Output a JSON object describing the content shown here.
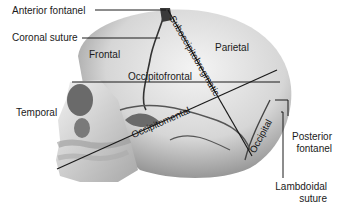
{
  "diagram": {
    "bones": [
      {
        "id": "frontal",
        "label": "Frontal"
      },
      {
        "id": "parietal",
        "label": "Parietal"
      },
      {
        "id": "temporal",
        "label": "Temporal"
      },
      {
        "id": "occipital",
        "label": "Occipital"
      }
    ],
    "landmarks": [
      {
        "id": "anterior-fontanel",
        "label": "Anterior fontanel"
      },
      {
        "id": "coronal-suture",
        "label": "Coronal suture"
      },
      {
        "id": "posterior-fontanel",
        "label": "Posterior fontanel",
        "lines": [
          "Posterior",
          "fontanel"
        ]
      },
      {
        "id": "lambdoidal-suture",
        "label": "Lambdoidal suture",
        "lines": [
          "Lambdoidal",
          "suture"
        ]
      }
    ],
    "diameters": [
      {
        "id": "suboccipitobregmatic",
        "label": "Suboccipitobregmatic"
      },
      {
        "id": "occipitofrontal",
        "label": "Occipitofrontal"
      },
      {
        "id": "occipitomental",
        "label": "Occipitomental"
      }
    ],
    "colors": {
      "background": "#ffffff",
      "skull_light": "#e8e8e8",
      "skull_mid": "#bdbdbd",
      "skull_dark": "#6e6e6e",
      "line": "#1a1a1a"
    }
  }
}
